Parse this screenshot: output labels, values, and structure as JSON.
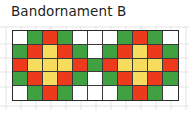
{
  "figure": {
    "title": "Bandornament B",
    "caption_label": "Bandornament B"
  },
  "palette": {
    "white": "#ffffff",
    "green": "#3fa13f",
    "red": "#ed3a1c",
    "yellow": "#f7dc5e",
    "grid_line": "#3a3a3a",
    "border": "#2b2b2b",
    "guide_line": "#dcdcdc",
    "text": "#231f20"
  },
  "chart_data": {
    "type": "heatmap",
    "title": "Bandornament B",
    "xlabel": "",
    "ylabel": "",
    "columns": 11,
    "rows": 5,
    "legend": [
      {
        "key": "w",
        "name": "white",
        "color": "#ffffff"
      },
      {
        "key": "g",
        "name": "green",
        "color": "#3fa13f"
      },
      {
        "key": "r",
        "name": "red",
        "color": "#ed3a1c"
      },
      {
        "key": "y",
        "name": "yellow",
        "color": "#f7dc5e"
      }
    ],
    "grid": [
      [
        "w",
        "g",
        "r",
        "g",
        "w",
        "w",
        "w",
        "g",
        "r",
        "g",
        "w"
      ],
      [
        "g",
        "r",
        "y",
        "r",
        "g",
        "w",
        "g",
        "r",
        "y",
        "r",
        "g"
      ],
      [
        "r",
        "y",
        "y",
        "y",
        "r",
        "g",
        "r",
        "y",
        "y",
        "y",
        "r"
      ],
      [
        "g",
        "r",
        "y",
        "r",
        "g",
        "w",
        "g",
        "r",
        "y",
        "r",
        "g"
      ],
      [
        "w",
        "g",
        "r",
        "g",
        "w",
        "w",
        "w",
        "g",
        "r",
        "g",
        "w"
      ]
    ]
  }
}
